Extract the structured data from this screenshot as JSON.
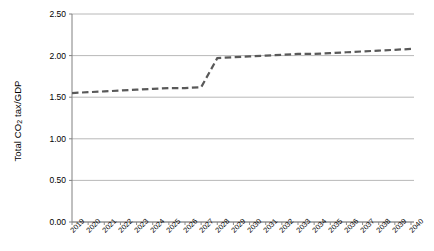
{
  "chart_data": {
    "type": "line",
    "title": "",
    "xlabel": "",
    "ylabel": "Total CO2 tax/GDP",
    "ylabel_html": "Total CO<sub>2</sub> tax/GDP",
    "ylim": [
      0.0,
      2.5
    ],
    "yticks": [
      0.0,
      0.5,
      1.0,
      1.5,
      2.0,
      2.5
    ],
    "ytick_labels": [
      "0.00",
      "0.50",
      "1.00",
      "1.50",
      "2.00",
      "2.50"
    ],
    "grid": true,
    "grid_axis": "y",
    "legend": false,
    "line_style": "dashed",
    "line_color": "#595959",
    "line_width": 2.2,
    "markers": "none",
    "categories": [
      "2019",
      "2020",
      "2021",
      "2022",
      "2023",
      "2024",
      "2025",
      "2026",
      "2027",
      "2028",
      "2029",
      "2030",
      "2031",
      "2032",
      "2033",
      "2034",
      "2035",
      "2036",
      "2037",
      "2038",
      "2039",
      "2040"
    ],
    "values": [
      1.55,
      1.56,
      1.57,
      1.58,
      1.59,
      1.6,
      1.61,
      1.61,
      1.62,
      1.97,
      1.98,
      1.99,
      2.0,
      2.01,
      2.02,
      2.02,
      2.03,
      2.04,
      2.05,
      2.06,
      2.07,
      2.08
    ],
    "series": [
      {
        "name": "Total CO2 tax/GDP",
        "values": [
          1.55,
          1.56,
          1.57,
          1.58,
          1.59,
          1.6,
          1.61,
          1.61,
          1.62,
          1.97,
          1.98,
          1.99,
          2.0,
          2.01,
          2.02,
          2.02,
          2.03,
          2.04,
          2.05,
          2.06,
          2.07,
          2.08
        ]
      }
    ],
    "annotations": []
  },
  "axes": {
    "y_title": "Total CO2 tax/GDP",
    "tick_color": "#808080",
    "axis_color": "#808080"
  }
}
